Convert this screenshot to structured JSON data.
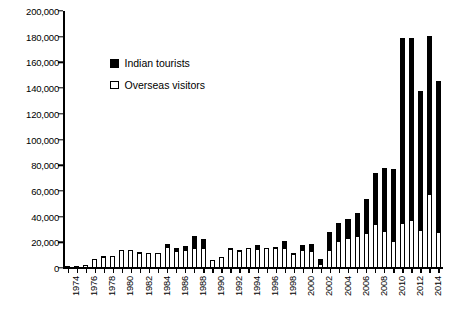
{
  "chart_data": {
    "type": "bar",
    "barmode": "stacked",
    "title": "",
    "subtitle": "",
    "xlabel": "",
    "ylabel": "",
    "ylim": [
      0,
      200000
    ],
    "ytick_values": [
      0,
      20000,
      40000,
      60000,
      80000,
      100000,
      120000,
      140000,
      160000,
      180000,
      200000
    ],
    "ytick_labels": [
      "0",
      "20,000",
      "40,000",
      "60,000",
      "80,000",
      "100,000",
      "120,000",
      "140,000",
      "160,000",
      "180,000",
      "200,000"
    ],
    "grid": false,
    "legend_position": "upper-left-inside",
    "xtick_label_rotation": 90,
    "xtick_labels_shown": [
      "1974",
      "1976",
      "1978",
      "1980",
      "1982",
      "1984",
      "1986",
      "1988",
      "1990",
      "1992",
      "1994",
      "1996",
      "1998",
      "2000",
      "2002",
      "2004",
      "2006",
      "2008",
      "2010",
      "2012",
      "2014"
    ],
    "categories": [
      "1974",
      "1975",
      "1976",
      "1977",
      "1978",
      "1979",
      "1980",
      "1981",
      "1982",
      "1983",
      "1984",
      "1985",
      "1986",
      "1987",
      "1988",
      "1989",
      "1990",
      "1991",
      "1992",
      "1993",
      "1994",
      "1995",
      "1996",
      "1997",
      "1998",
      "1999",
      "2000",
      "2001",
      "2002",
      "2003",
      "2004",
      "2005",
      "2006",
      "2007",
      "2008",
      "2009",
      "2010",
      "2011",
      "2012",
      "2013",
      "2014",
      "2015"
    ],
    "series": [
      {
        "name": "Overseas visitors",
        "color": "#ffffff",
        "edge_color": "#000000",
        "stack_position": "bottom",
        "values": [
          300,
          500,
          2200,
          7000,
          8800,
          9200,
          13800,
          13800,
          11800,
          11600,
          11500,
          16000,
          13200,
          14200,
          15800,
          15700,
          6000,
          8400,
          14800,
          13500,
          15500,
          14800,
          15200,
          15600,
          15800,
          11200,
          13800,
          13600,
          3200,
          14200,
          20800,
          23600,
          24800,
          27400,
          34200,
          28800,
          21000,
          34800,
          37400,
          29600,
          57400,
          28200
        ]
      },
      {
        "name": "Indian tourists",
        "color": "#000000",
        "edge_color": "#000000",
        "stack_position": "top",
        "values": [
          0,
          0,
          400,
          0,
          400,
          400,
          300,
          200,
          400,
          200,
          200,
          2800,
          2000,
          3000,
          9000,
          6900,
          0,
          0,
          400,
          300,
          400,
          2900,
          600,
          700,
          5600,
          400,
          3800,
          5000,
          4000,
          13800,
          14000,
          14200,
          18400,
          26400,
          39600,
          49000,
          56200,
          144000,
          141400,
          107800,
          123400,
          117400
        ]
      }
    ],
    "totals": [
      300,
      500,
      2600,
      7000,
      9200,
      9600,
      14100,
      14000,
      12200,
      11800,
      11700,
      18800,
      15200,
      17200,
      24800,
      22600,
      6000,
      8400,
      15200,
      13800,
      15900,
      17700,
      15800,
      16300,
      21400,
      11600,
      17600,
      18600,
      7200,
      28000,
      34800,
      37800,
      43200,
      53800,
      73800,
      77800,
      77200,
      178800,
      178800,
      137400,
      180800,
      145600
    ]
  },
  "legend": {
    "items": [
      {
        "label": "Indian tourists",
        "marker": "filled-square"
      },
      {
        "label": "Overseas visitors",
        "marker": "open-square"
      }
    ]
  }
}
